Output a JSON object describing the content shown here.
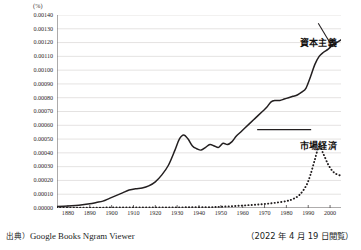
{
  "chart_data": {
    "type": "line",
    "title": "",
    "xlabel": "年",
    "ylabel": "%",
    "unit_label": "(%)",
    "xaxis_unit": "(年)",
    "xlim": [
      1875,
      2005
    ],
    "ylim": [
      0.0,
      0.0014
    ],
    "grid": true,
    "legend_position": "inline-annotation",
    "ytick_labels": [
      "0.00140",
      "0.00130",
      "0.00120",
      "0.00110",
      "0.00100",
      "0.00090",
      "0.00080",
      "0.00070",
      "0.00060",
      "0.00050",
      "0.00040",
      "0.00030",
      "0.00020",
      "0.00010",
      "0.00000"
    ],
    "ytick_values": [
      0.0014,
      0.0013,
      0.0012,
      0.0011,
      0.001,
      0.0009,
      0.0008,
      0.0007,
      0.0006,
      0.0005,
      0.0004,
      0.0003,
      0.0002,
      0.0001,
      0.0
    ],
    "xtick_labels": [
      "1880",
      "1890",
      "1900",
      "1910",
      "1920",
      "1930",
      "1940",
      "1950",
      "1960",
      "1970",
      "1980",
      "1990",
      "2000"
    ],
    "xtick_values": [
      1880,
      1890,
      1900,
      1910,
      1920,
      1930,
      1940,
      1950,
      1960,
      1970,
      1980,
      1990,
      2000
    ],
    "series": [
      {
        "name": "資本主義",
        "style": "solid",
        "color": "#231f20",
        "x": [
          1875,
          1880,
          1885,
          1890,
          1893,
          1896,
          1899,
          1902,
          1905,
          1908,
          1911,
          1914,
          1917,
          1920,
          1923,
          1926,
          1929,
          1931,
          1933,
          1935,
          1937,
          1939,
          1941,
          1943,
          1945,
          1947,
          1949,
          1951,
          1953,
          1955,
          1957,
          1959,
          1961,
          1963,
          1965,
          1967,
          1969,
          1971,
          1973,
          1975,
          1977,
          1979,
          1981,
          1983,
          1985,
          1987,
          1989,
          1991,
          1993,
          1995,
          1997,
          1999,
          2001,
          2003,
          2005
        ],
        "y": [
          1e-05,
          1.5e-05,
          2e-05,
          3e-05,
          4e-05,
          5e-05,
          7e-05,
          9e-05,
          0.00011,
          0.00013,
          0.00014,
          0.000145,
          0.00016,
          0.00019,
          0.00024,
          0.00031,
          0.00042,
          0.0005,
          0.00053,
          0.0005,
          0.00045,
          0.00043,
          0.00042,
          0.00044,
          0.00046,
          0.00045,
          0.00044,
          0.00047,
          0.00046,
          0.00048,
          0.00052,
          0.00055,
          0.00058,
          0.00061,
          0.00064,
          0.00067,
          0.0007,
          0.00073,
          0.00077,
          0.00078,
          0.00078,
          0.00079,
          0.0008,
          0.00081,
          0.00082,
          0.00084,
          0.00087,
          0.00095,
          0.00104,
          0.0011,
          0.00113,
          0.00115,
          0.00118,
          0.0012,
          0.00122
        ]
      },
      {
        "name": "市場経済",
        "style": "dotted",
        "color": "#231f20",
        "x": [
          1875,
          1885,
          1895,
          1905,
          1915,
          1925,
          1935,
          1945,
          1950,
          1955,
          1960,
          1965,
          1970,
          1975,
          1980,
          1983,
          1986,
          1989,
          1991,
          1993,
          1995,
          1997,
          1999,
          2001,
          2003,
          2005
        ],
        "y": [
          2e-06,
          2.5e-06,
          3e-06,
          3.5e-06,
          4e-06,
          4.5e-06,
          5e-06,
          6e-06,
          9e-06,
          1.3e-05,
          1.8e-05,
          2.3e-05,
          2.9e-05,
          3.8e-05,
          5e-05,
          6.5e-05,
          9.5e-05,
          0.00016,
          0.00024,
          0.00035,
          0.000445,
          0.00039,
          0.00032,
          0.00027,
          0.000245,
          0.000235
        ]
      }
    ]
  },
  "annotations": {
    "capitalism": "資本主義",
    "market_economy": "市場経済"
  },
  "footer": {
    "source_label": "出典）",
    "source_value": "Google Books Ngram Viewer",
    "access_note": "（2022 年 4 月 19 日閲覧）"
  }
}
